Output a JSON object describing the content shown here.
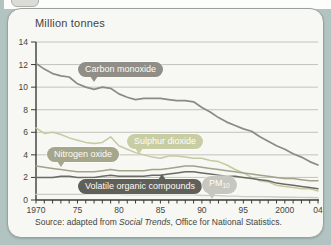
{
  "page_background": "#b2c4c2",
  "card": {
    "background": "#f7f7f3",
    "border_color": "#9aa09d"
  },
  "chart": {
    "title": "Million tonnes",
    "source_prefix": "Source: adapted from ",
    "source_italic": "Social Trends",
    "source_suffix": ", Office for National Statistics."
  },
  "chart_data": {
    "type": "line",
    "title": "Million tonnes",
    "ylabel": "Million tonnes",
    "xlabel": "Year",
    "x_start": 1970,
    "x_end": 2004,
    "ylim": [
      0,
      14
    ],
    "yticks": [
      0,
      2,
      4,
      6,
      8,
      10,
      12,
      14
    ],
    "xtick_labels": [
      {
        "year": 1970,
        "label": "1970"
      },
      {
        "year": 1975,
        "label": "75"
      },
      {
        "year": 1980,
        "label": "80"
      },
      {
        "year": 1985,
        "label": "85"
      },
      {
        "year": 1990,
        "label": "90"
      },
      {
        "year": 1995,
        "label": "95"
      },
      {
        "year": 2000,
        "label": "2000"
      },
      {
        "year": 2004,
        "label": "04"
      }
    ],
    "grid": true,
    "legend_position": "inline-labels",
    "series": [
      {
        "id": "carbon-monoxide",
        "name": "Carbon monoxide",
        "color": "#8b8b84",
        "pill_color": "#908e87",
        "width": 1.7,
        "values": [
          12.1,
          11.6,
          11.2,
          11.0,
          10.9,
          10.3,
          10.0,
          9.8,
          10.0,
          9.9,
          9.4,
          9.1,
          8.9,
          9.0,
          9.0,
          9.0,
          8.9,
          8.8,
          8.8,
          8.7,
          8.2,
          7.8,
          7.3,
          6.9,
          6.6,
          6.3,
          6.1,
          5.6,
          5.2,
          4.8,
          4.5,
          4.1,
          3.8,
          3.4,
          3.1
        ]
      },
      {
        "id": "sulphur-dioxide",
        "name": "Sulphur dioxide",
        "color": "#c6caa0",
        "pill_color": "#c9cda4",
        "width": 1.5,
        "values": [
          6.4,
          5.9,
          6.0,
          5.8,
          5.5,
          5.3,
          5.1,
          5.0,
          5.1,
          5.6,
          4.8,
          4.5,
          4.2,
          4.0,
          3.8,
          3.7,
          3.9,
          3.9,
          3.8,
          3.7,
          3.7,
          3.5,
          3.4,
          3.1,
          2.7,
          2.4,
          2.0,
          1.7,
          1.6,
          1.3,
          1.2,
          1.1,
          1.0,
          1.0,
          0.8
        ]
      },
      {
        "id": "nitrogen-oxide",
        "name": "Nitrogen oxide",
        "color": "#a2a389",
        "pill_color": "#a5a68a",
        "width": 1.5,
        "values": [
          3.0,
          2.9,
          2.8,
          2.7,
          2.6,
          2.5,
          2.5,
          2.5,
          2.6,
          2.7,
          2.6,
          2.6,
          2.6,
          2.6,
          2.7,
          2.7,
          2.8,
          2.9,
          3.0,
          3.0,
          2.9,
          2.8,
          2.7,
          2.6,
          2.5,
          2.4,
          2.3,
          2.2,
          2.1,
          2.0,
          1.9,
          1.9,
          1.8,
          1.7,
          1.7
        ]
      },
      {
        "id": "volatile-organic-compounds",
        "name": "Volatile organic compounds",
        "color": "#6b6b64",
        "pill_color": "#60605a",
        "width": 1.5,
        "values": [
          2.0,
          2.0,
          2.0,
          2.1,
          2.1,
          2.0,
          2.0,
          2.0,
          2.1,
          2.2,
          2.1,
          2.1,
          2.1,
          2.1,
          2.2,
          2.2,
          2.3,
          2.4,
          2.5,
          2.5,
          2.4,
          2.3,
          2.2,
          2.1,
          2.1,
          2.0,
          1.9,
          1.8,
          1.7,
          1.5,
          1.4,
          1.3,
          1.2,
          1.1,
          1.0
        ]
      },
      {
        "id": "pm10",
        "name": "PM10",
        "label_main": "PM",
        "label_sub": "10",
        "color": "#cdcdc5",
        "pill_color": "#c7c7c0",
        "width": 1.4,
        "values": [
          0.5,
          0.5,
          0.5,
          0.5,
          0.5,
          0.5,
          0.5,
          0.5,
          0.5,
          0.5,
          0.5,
          0.45,
          0.45,
          0.45,
          0.45,
          0.45,
          0.45,
          0.45,
          0.45,
          0.45,
          0.4,
          0.4,
          0.4,
          0.35,
          0.35,
          0.3,
          0.3,
          0.3,
          0.28,
          0.27,
          0.25,
          0.24,
          0.23,
          0.22,
          0.2
        ]
      }
    ]
  }
}
